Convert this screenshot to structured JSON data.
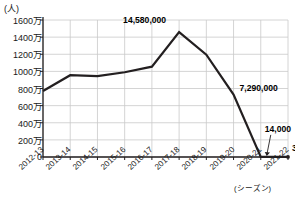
{
  "chart_data": {
    "type": "line",
    "title": "",
    "subtitle": "",
    "unit_label": "(人)",
    "xlabel": "(シーズン)",
    "ylabel": "",
    "categories": [
      "2012-13",
      "2013-14",
      "2014-15",
      "2015-16",
      "2016-17",
      "2017-18",
      "2018-19",
      "2019-20",
      "2020-21",
      "2021-22"
    ],
    "values": [
      7700000,
      9550000,
      9450000,
      9900000,
      10550000,
      14580000,
      11950000,
      7290000,
      14000,
      3000
    ],
    "ytick_labels": [
      "0",
      "200万",
      "400万",
      "600万",
      "800万",
      "1000万",
      "1200万",
      "1400万",
      "1600万"
    ],
    "ytick_values": [
      0,
      2000000,
      4000000,
      6000000,
      8000000,
      10000000,
      12000000,
      14000000,
      16000000
    ],
    "ylim": [
      0,
      16000000
    ],
    "grid": true,
    "legend": "none",
    "series": [
      {
        "name": "観客数",
        "values": [
          7700000,
          9550000,
          9450000,
          9900000,
          10550000,
          14580000,
          11950000,
          7290000,
          14000,
          3000
        ]
      }
    ],
    "annotations": [
      {
        "label": "14,580,000",
        "category": "2017-18",
        "value": 14580000
      },
      {
        "label": "7,290,000",
        "category": "2019-20",
        "value": 7290000
      },
      {
        "label": "14,000",
        "category": "2020-21",
        "value": 14000
      },
      {
        "label": "3000",
        "category": "2021-22",
        "value": 3000
      }
    ],
    "colors": {
      "line": "#231f20",
      "grid": "#c9c9c9",
      "axis": "#231f20",
      "text": "#1a1a1a",
      "background": "#ffffff"
    }
  }
}
